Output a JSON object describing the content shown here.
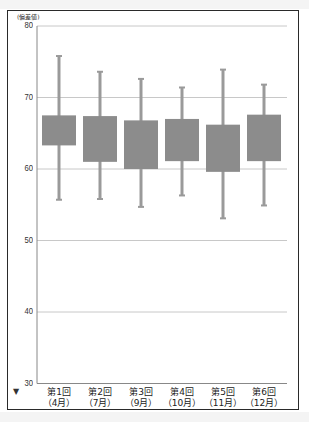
{
  "chart_data": {
    "type": "box",
    "title": "",
    "ylabel": "(偏差値)",
    "xlabel": "",
    "ylim": [
      30,
      80
    ],
    "yticks": [
      30,
      40,
      50,
      60,
      70,
      80
    ],
    "grid": true,
    "categories": [
      {
        "line1": "第1回",
        "line2": "（4月）"
      },
      {
        "line1": "第2回",
        "line2": "（7月）"
      },
      {
        "line1": "第3回",
        "line2": "（9月）"
      },
      {
        "line1": "第4回",
        "line2": "（10月）"
      },
      {
        "line1": "第5回",
        "line2": "（11月）"
      },
      {
        "line1": "第6回",
        "line2": "（12月）"
      }
    ],
    "series": [
      {
        "name": "第1回（4月）",
        "min": 55.7,
        "q1": 63.3,
        "q3": 67.5,
        "max": 75.8
      },
      {
        "name": "第2回（7月）",
        "min": 55.8,
        "q1": 61.0,
        "q3": 67.4,
        "max": 73.6
      },
      {
        "name": "第3回（9月）",
        "min": 54.7,
        "q1": 60.0,
        "q3": 66.8,
        "max": 72.6
      },
      {
        "name": "第4回（10月）",
        "min": 56.3,
        "q1": 61.1,
        "q3": 67.0,
        "max": 71.4
      },
      {
        "name": "第5回（11月）",
        "min": 53.1,
        "q1": 59.6,
        "q3": 66.2,
        "max": 73.9
      },
      {
        "name": "第6回（12月）",
        "min": 54.9,
        "q1": 61.1,
        "q3": 67.6,
        "max": 71.8
      }
    ]
  },
  "colors": {
    "box_fill": "#8c8c8c",
    "whisker": "#9a9a9a",
    "grid": "#c8c8c8",
    "axis": "#888888",
    "frame": "#2a2a2a"
  },
  "axis_arrow": "▼"
}
